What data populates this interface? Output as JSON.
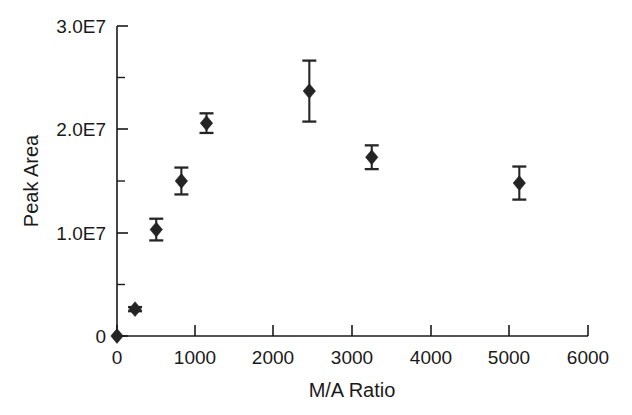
{
  "chart_data": {
    "type": "scatter",
    "title": "",
    "xlabel": "M/A Ratio",
    "ylabel": "Peak Area",
    "xlim": [
      0,
      6000
    ],
    "ylim": [
      0,
      30000000
    ],
    "grid": false,
    "legend": "none",
    "marker": "filled-diamond",
    "error_bars": "vertical",
    "x_ticks": [
      0,
      1000,
      2000,
      3000,
      4000,
      5000,
      6000
    ],
    "x_tick_labels": [
      "0",
      "1000",
      "2000",
      "3000",
      "4000",
      "5000",
      "6000"
    ],
    "y_ticks": [
      0,
      10000000,
      20000000,
      30000000
    ],
    "y_tick_labels": [
      "0",
      "1.0E7",
      "2.0E7",
      "3.0E7"
    ],
    "y_minor_ticks": [
      5000000,
      15000000,
      25000000
    ],
    "series": [
      {
        "name": "Peak Area",
        "x": [
          0,
          230,
          500,
          820,
          1140,
          2450,
          3245,
          5125
        ],
        "y": [
          0,
          2600000,
          10300000,
          15000000,
          20600000,
          23700000,
          17300000,
          14800000
        ],
        "yerr": [
          0,
          200000,
          1050000,
          1300000,
          950000,
          2950000,
          1150000,
          1600000
        ]
      }
    ]
  },
  "axes": {
    "x_axis_name": "M/A Ratio",
    "y_axis_name": "Peak Area"
  }
}
